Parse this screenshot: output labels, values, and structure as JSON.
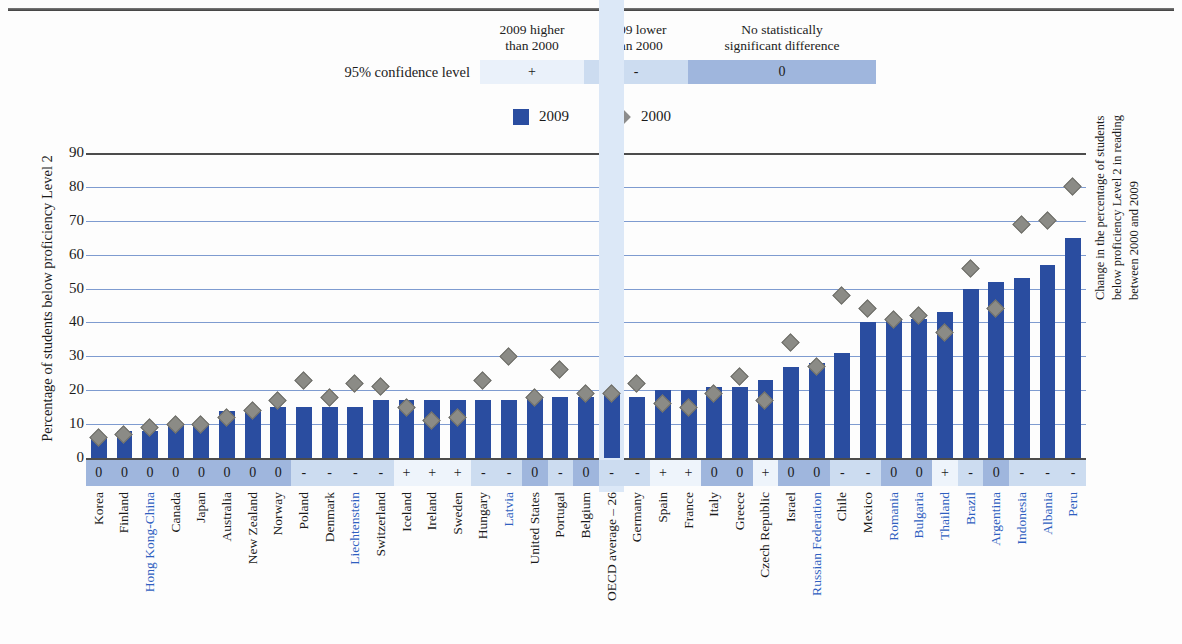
{
  "significance_legend": {
    "row_label": "95% confidence level",
    "headers": [
      "2009 higher\nthan 2000",
      "2009 lower\nthan 2000",
      "No statistically\nsignificant difference"
    ],
    "header_1_line1": "2009 higher",
    "header_1_line2": "than 2000",
    "header_2_line1": "2009 lower",
    "header_2_line2": "than 2000",
    "header_3_line1": "No statistically",
    "header_3_line2": "significant difference",
    "symbols": {
      "higher": "+",
      "lower": "-",
      "nodiff": "0"
    },
    "colors": {
      "higher": "#eaf1fa",
      "lower": "#ccdcf0",
      "nodiff": "#9fb6dd"
    }
  },
  "series_legend": {
    "items": [
      {
        "label": "2009",
        "marker": "square",
        "color": "#2a4da0"
      },
      {
        "label": "2000",
        "marker": "diamond",
        "color": "#8c8c8c"
      }
    ],
    "label_2009": "2009",
    "label_2000": "2000"
  },
  "axis_titles": {
    "left": "Percentage of students below proficiency Level 2",
    "right_line1": "Change in the percentage of students",
    "right_line2": "below proficiency Level 2 in reading",
    "right_line3": "between 2000 and 2009"
  },
  "chart_data": {
    "type": "bar",
    "title": "",
    "xlabel": "",
    "ylabel": "Percentage of students below proficiency Level 2",
    "ylim": [
      0,
      90
    ],
    "yticks": [
      0,
      10,
      20,
      30,
      40,
      50,
      60,
      70,
      80,
      90
    ],
    "grid": true,
    "legend_position": "top-center",
    "categories": [
      "Korea",
      "Finland",
      "Hong Kong-China",
      "Canada",
      "Japan",
      "Australia",
      "New Zealand",
      "Norway",
      "Poland",
      "Denmark",
      "Liechtenstein",
      "Switzerland",
      "Iceland",
      "Ireland",
      "Sweden",
      "Hungary",
      "Latvia",
      "United States",
      "Portugal",
      "Belgium",
      "OECD average – 26",
      "Germany",
      "Spain",
      "France",
      "Italy",
      "Greece",
      "Czech Republic",
      "Israel",
      "Russian Federation",
      "Chile",
      "Mexico",
      "Romania",
      "Bulgaria",
      "Thailand",
      "Brazil",
      "Argentina",
      "Indonesia",
      "Albania",
      "Peru"
    ],
    "highlighted_category": "OECD average – 26",
    "blue_labelled_categories": [
      "Hong Kong-China",
      "Liechtenstein",
      "Latvia",
      "Russian Federation",
      "Romania",
      "Bulgaria",
      "Thailand",
      "Brazil",
      "Argentina",
      "Indonesia",
      "Albania",
      "Peru"
    ],
    "series": [
      {
        "name": "2009",
        "type": "bar",
        "color": "#2a4da0",
        "values": [
          6,
          8,
          8,
          10,
          10,
          14,
          14,
          15,
          15,
          15,
          15,
          17,
          17,
          17,
          17,
          17,
          17,
          18,
          18,
          18,
          19,
          18,
          20,
          20,
          21,
          21,
          23,
          27,
          28,
          31,
          40,
          41,
          41,
          43,
          50,
          52,
          53,
          57,
          65
        ]
      },
      {
        "name": "2000",
        "type": "scatter",
        "marker": "diamond",
        "color": "#8c8c8c",
        "values": [
          6,
          7,
          9,
          10,
          10,
          12,
          14,
          17,
          23,
          18,
          22,
          21,
          15,
          11,
          12,
          23,
          30,
          18,
          26,
          19,
          19,
          22,
          16,
          15,
          19,
          24,
          17,
          34,
          27,
          48,
          44,
          41,
          42,
          37,
          56,
          44,
          69,
          70,
          80
        ]
      }
    ],
    "significance": [
      "0",
      "0",
      "0",
      "0",
      "0",
      "0",
      "0",
      "0",
      "-",
      "-",
      "-",
      "-",
      "+",
      "+",
      "+",
      "-",
      "-",
      "0",
      "-",
      "0",
      "-",
      "-",
      "+",
      "+",
      "0",
      "0",
      "+",
      "0",
      "0",
      "-",
      "-",
      "0",
      "0",
      "+",
      "-",
      "0",
      "-",
      "-",
      "-"
    ]
  }
}
